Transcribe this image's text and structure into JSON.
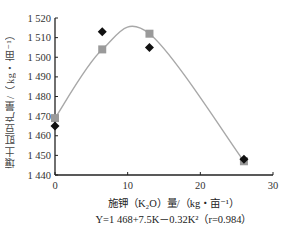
{
  "chart_data": {
    "type": "scatter",
    "title": "",
    "xlabel": "施钾（K₂O）量/（kg・亩⁻¹）",
    "ylabel": "壤土豇豆产量/（kg・亩⁻¹）",
    "equation": "Y=1 468+7.5K－0.32K²（r=0.984）",
    "xlim": [
      0,
      30
    ],
    "ylim": [
      1440,
      1520
    ],
    "x_ticks": [
      0,
      10,
      20,
      30
    ],
    "x_tick_labels": [
      "0",
      "10",
      "20",
      "30"
    ],
    "y_ticks": [
      1440,
      1450,
      1460,
      1470,
      1480,
      1490,
      1500,
      1510,
      1520
    ],
    "y_tick_labels": [
      "1 440",
      "1 450",
      "1 460",
      "1 470",
      "1 480",
      "1 490",
      "1 500",
      "1 510",
      "1 520"
    ],
    "grid": false,
    "legend": "none",
    "series": [
      {
        "name": "observed",
        "marker": "diamond",
        "color": "#111111",
        "x": [
          0,
          6.5,
          13,
          26
        ],
        "y": [
          1465,
          1513,
          1505,
          1448
        ]
      },
      {
        "name": "fitted",
        "marker": "square",
        "color": "#9a9a9a",
        "x": [
          0,
          6.5,
          13,
          26
        ],
        "y": [
          1469,
          1504,
          1512,
          1447
        ]
      },
      {
        "name": "fit-curve",
        "type": "line",
        "color": "#a8a8a8",
        "coefficients": {
          "a": 1468,
          "b": 7.5,
          "c": -0.32
        }
      }
    ]
  }
}
